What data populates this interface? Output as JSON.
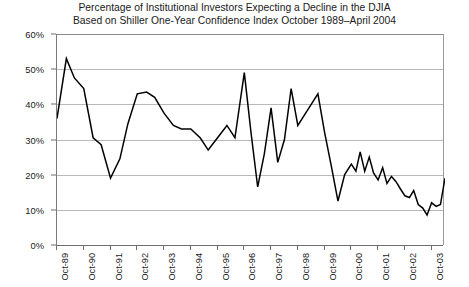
{
  "chart_data": {
    "type": "line",
    "title": "Percentage of Institutional Investors Expecting a Decline in the DJIA",
    "subtitle": "Based on Shiller One-Year Confidence Index October 1989–April 2004",
    "xlabel": "",
    "ylabel": "",
    "ylim": [
      0,
      60
    ],
    "ytick_labels": [
      "0%",
      "10%",
      "20%",
      "30%",
      "40%",
      "50%",
      "60%"
    ],
    "ytick_values": [
      0,
      10,
      20,
      30,
      40,
      50,
      60
    ],
    "xtick_labels": [
      "Oct-89",
      "Oct-90",
      "Oct-91",
      "Oct-92",
      "Oct-93",
      "Oct-94",
      "Oct-95",
      "Oct-96",
      "Oct-97",
      "Oct-98",
      "Oct-99",
      "Oct-00",
      "Oct-01",
      "Oct-02",
      "Oct-03"
    ],
    "xtick_values": [
      1989.75,
      1990.75,
      1991.75,
      1992.75,
      1993.75,
      1994.75,
      1995.75,
      1996.75,
      1997.75,
      1998.75,
      1999.75,
      2000.75,
      2001.75,
      2002.75,
      2003.75
    ],
    "xlim": [
      1989.75,
      2004.25
    ],
    "grid": "horizontal",
    "legend": "none",
    "line_color": "#000000",
    "grid_color": "#b9b9b9",
    "axis_color": "#6e6e6e",
    "series": [
      {
        "name": "Percentage of institutional investors expecting a decline in the DJIA",
        "x": [
          1989.75,
          1990.1,
          1990.4,
          1990.75,
          1991.1,
          1991.4,
          1991.75,
          1992.1,
          1992.4,
          1992.75,
          1993.1,
          1993.4,
          1993.75,
          1994.1,
          1994.4,
          1994.75,
          1995.1,
          1995.4,
          1995.75,
          1996.1,
          1996.4,
          1996.75,
          1997.0,
          1997.25,
          1997.5,
          1997.75,
          1998.0,
          1998.25,
          1998.5,
          1998.75,
          1999.0,
          1999.25,
          1999.5,
          1999.75,
          2000.0,
          2000.25,
          2000.5,
          2000.75,
          2000.92,
          2001.08,
          2001.25,
          2001.42,
          2001.58,
          2001.75,
          2001.92,
          2002.08,
          2002.25,
          2002.42,
          2002.58,
          2002.75,
          2002.92,
          2003.08,
          2003.25,
          2003.42,
          2003.58,
          2003.75,
          2003.92,
          2004.08,
          2004.25
        ],
        "y": [
          36.0,
          53.0,
          47.5,
          44.5,
          30.5,
          28.5,
          19.0,
          24.5,
          34.5,
          43.0,
          43.5,
          42.0,
          37.5,
          34.0,
          33.0,
          33.0,
          30.5,
          27.0,
          30.5,
          34.0,
          30.5,
          49.0,
          32.0,
          16.5,
          26.0,
          39.0,
          23.5,
          30.0,
          44.5,
          34.0,
          37.0,
          40.0,
          43.0,
          32.0,
          22.5,
          12.5,
          20.0,
          23.0,
          21.0,
          26.5,
          21.0,
          25.0,
          20.5,
          18.5,
          22.0,
          17.5,
          19.5,
          18.0,
          16.0,
          14.0,
          13.5,
          15.5,
          11.5,
          10.5,
          8.5,
          12.0,
          11.0,
          11.5,
          19.0
        ]
      }
    ]
  }
}
